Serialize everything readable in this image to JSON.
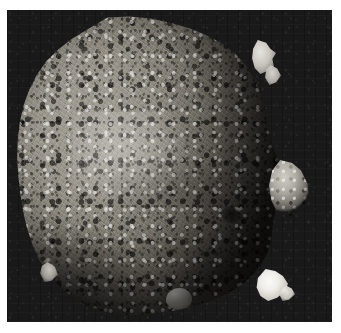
{
  "image": {
    "kind": "photograph",
    "subject": "asteroid",
    "object_name": "Bennu",
    "description": "Grayscale spacecraft photograph of a rubble-pile asteroid, lit from the upper left, set against black space",
    "rendering": "grayscale",
    "frame": {
      "x": 7,
      "y": 10,
      "width": 325,
      "height": 312
    },
    "canvas": {
      "width": 341,
      "height": 333
    }
  },
  "colors": {
    "page_background": "#ffffff",
    "space_background": "#191919",
    "regolith_highlight": "#d8d6d1",
    "regolith_midtone": "#b0ada5",
    "regolith_shadow": "#55524d",
    "boulder_bright": "#fbfaf7",
    "boulder_dark": "#141414"
  },
  "features": [
    {
      "id": "asteroid-body",
      "label": "asteroid body",
      "note": "Irregular top-heavy ovoid silhouette filling most of the frame"
    },
    {
      "id": "boulder-limb-upper",
      "label": "bright boulders breaking the upper-right limb"
    },
    {
      "id": "boulder-limb-upper2",
      "label": "small bright boulder on the upper-right limb"
    },
    {
      "id": "boulder-limb-mid",
      "label": "prominent boulder protruding from the mid-right limb"
    },
    {
      "id": "boulder-bright-lower",
      "label": "very bright boulder on the lower-right limb"
    },
    {
      "id": "boulder-bright-lower-tip",
      "label": "bright boulder fragment beyond the lower-right limb"
    },
    {
      "id": "boulder-limb-left",
      "label": "boulder spur on the lower-left limb"
    },
    {
      "id": "boulder-shadow-centre",
      "label": "large shadowed boulder near the centre-right"
    },
    {
      "id": "boulder-rounded-lowcentre",
      "label": "rounded boulder in the lower-centre region"
    },
    {
      "id": "highlight-upper-left",
      "label": "sunlit highlight across the upper-left face"
    },
    {
      "id": "mottle-band",
      "label": "darker mottled equatorial band"
    },
    {
      "id": "terminator",
      "label": "terminator shading along the right flank"
    },
    {
      "id": "limb-shade",
      "label": "limb darkening around the circumference"
    },
    {
      "id": "bottom-shadow",
      "label": "shadowed crescent along the bottom-left limb"
    }
  ]
}
